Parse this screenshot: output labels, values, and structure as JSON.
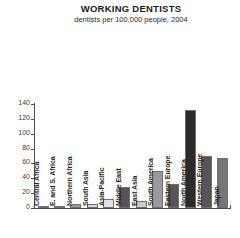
{
  "chart_data": {
    "type": "bar",
    "title": "WORKING DENTISTS",
    "subtitle": "dentists per 100,000 people, 2004",
    "xlabel": "",
    "ylabel": "",
    "ylim": [
      0,
      140
    ],
    "yticks": [
      0,
      20,
      40,
      60,
      80,
      100,
      120,
      140
    ],
    "ytick_labels": [
      "0",
      "20",
      "40",
      "60",
      "80",
      "100",
      "120",
      "140"
    ],
    "grid": false,
    "legend": "none",
    "categories": [
      "Central Africa",
      "E. and S. Africa",
      "Northern Africa",
      "South Asia",
      "Asia-Pacific",
      "Middle East",
      "East Asia",
      "South America",
      "Eastern Europe",
      "North America",
      "Western Europe",
      "Japan"
    ],
    "values": [
      1,
      3,
      6,
      5,
      12,
      28,
      10,
      50,
      33,
      132,
      70,
      67
    ],
    "bar_colors": [
      "#9a9a9a",
      "#555555",
      "#9a9a9a",
      "#d8d8d8",
      "#e2e2e2",
      "#555555",
      "#c9c9c9",
      "#9a9a9a",
      "#555555",
      "#2b2b2b",
      "#555555",
      "#757575"
    ]
  },
  "colors": {
    "axis": "#4d4d4d",
    "text": "#1f1f1f",
    "background": "#ffffff"
  }
}
